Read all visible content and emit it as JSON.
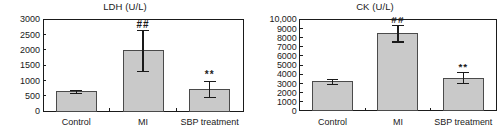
{
  "figure": {
    "background": "#ffffff",
    "bar_fill": "#c9c9c9",
    "bar_stroke": "#4a4a4a",
    "text_color": "#1a1a1a"
  },
  "chart_data": [
    {
      "type": "bar",
      "title": "LDH (U/L)",
      "xlabel": "",
      "ylabel": "",
      "ylim": [
        0,
        3000
      ],
      "ytick_step": 500,
      "ytick_labels": [
        "0",
        "500",
        "1000",
        "1500",
        "2000",
        "2500",
        "3000"
      ],
      "ytick_values": [
        0,
        500,
        1000,
        1500,
        2000,
        2500,
        3000
      ],
      "grid": false,
      "legend": "none",
      "categories": [
        "Control",
        "MI",
        "SBP treatment"
      ],
      "values": [
        620,
        1960,
        700
      ],
      "errors": [
        60,
        660,
        265
      ],
      "annotations": [
        "",
        "##",
        "**"
      ]
    },
    {
      "type": "bar",
      "title": "CK (U/L)",
      "xlabel": "",
      "ylabel": "",
      "ylim": [
        0,
        10000
      ],
      "ytick_step": 1000,
      "ytick_labels": [
        "0",
        "1000",
        "2000",
        "3000",
        "4000",
        "5000",
        "6000",
        "7000",
        "8000",
        "9000",
        "10,000"
      ],
      "ytick_values": [
        0,
        1000,
        2000,
        3000,
        4000,
        5000,
        6000,
        7000,
        8000,
        9000,
        10000
      ],
      "grid": false,
      "legend": "none",
      "categories": [
        "Control",
        "MI",
        "SBP treatment"
      ],
      "values": [
        3150,
        8400,
        3550
      ],
      "errors": [
        300,
        900,
        600
      ],
      "annotations": [
        "",
        "##",
        "**"
      ]
    }
  ]
}
